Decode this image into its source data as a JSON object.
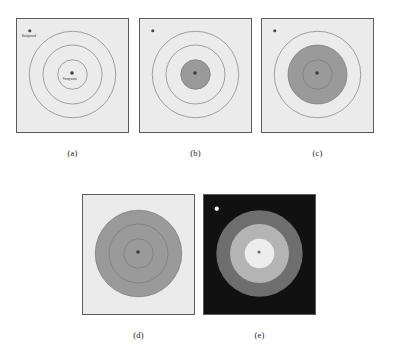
{
  "figure": {
    "background_color": "#ffffff",
    "width": 393,
    "height": 360
  },
  "labels": {
    "background": "Background",
    "foreground": "Foreground"
  },
  "colors": {
    "panel_border": "#5a5a5a",
    "image_background": "#ebebeb",
    "contour_stroke": "#8a8a8a",
    "fill_gray": "#9a9a9a",
    "result_background": "#111111",
    "ring_outer": "#6e6e6e",
    "ring_middle": "#b4b4b4",
    "ring_inner": "#ededed",
    "seed_background_dark": "#4a4a4a",
    "seed_background_light": "#f2f2f2",
    "seed_foreground": "#3c3c3c"
  },
  "panels": [
    {
      "id": "a",
      "caption": "(a)",
      "type": "input-with-seeds",
      "x": 16,
      "y": 18,
      "w": 113,
      "h": 115,
      "caption_x": 16,
      "caption_y": 148,
      "caption_w": 113,
      "background": "#ebebeb",
      "filled_ring_index": -1,
      "circles": [
        {
          "name": "outer-contour",
          "r": 44,
          "fill": "none",
          "stroke": "#8a8a8a"
        },
        {
          "name": "middle-contour",
          "r": 30,
          "fill": "none",
          "stroke": "#8a8a8a"
        },
        {
          "name": "inner-contour",
          "r": 15,
          "fill": "none",
          "stroke": "#8a8a8a"
        }
      ],
      "seeds": [
        {
          "name": "background-seed",
          "cx": 13,
          "cy": 12,
          "r": 1.6,
          "color": "#4a4a4a",
          "label": "Background",
          "label_x": 5,
          "label_y": 16
        },
        {
          "name": "foreground-seed",
          "cx": 56,
          "cy": 55,
          "r": 1.8,
          "color": "#3c3c3c",
          "label": "Foreground",
          "label_x": 46,
          "label_y": 59
        }
      ]
    },
    {
      "id": "b",
      "caption": "(b)",
      "type": "growing-step",
      "x": 139,
      "y": 18,
      "w": 113,
      "h": 115,
      "caption_x": 139,
      "caption_y": 148,
      "caption_w": 113,
      "background": "#ebebeb",
      "filled_ring_index": 2,
      "circles": [
        {
          "name": "outer-contour",
          "r": 44,
          "fill": "none",
          "stroke": "#8a8a8a"
        },
        {
          "name": "middle-contour",
          "r": 30,
          "fill": "none",
          "stroke": "#8a8a8a"
        },
        {
          "name": "inner-contour",
          "r": 15,
          "fill": "#9a9a9a",
          "stroke": "#7d7d7d"
        }
      ],
      "seeds": [
        {
          "name": "background-seed",
          "cx": 13,
          "cy": 12,
          "r": 1.6,
          "color": "#4a4a4a",
          "label": "",
          "label_x": 0,
          "label_y": 0
        },
        {
          "name": "foreground-seed",
          "cx": 56,
          "cy": 55,
          "r": 1.8,
          "color": "#3c3c3c",
          "label": "",
          "label_x": 0,
          "label_y": 0
        }
      ]
    },
    {
      "id": "c",
      "caption": "(c)",
      "type": "growing-step",
      "x": 261,
      "y": 18,
      "w": 113,
      "h": 115,
      "caption_x": 261,
      "caption_y": 148,
      "caption_w": 113,
      "background": "#ebebeb",
      "filled_ring_index": 1,
      "circles": [
        {
          "name": "outer-contour",
          "r": 44,
          "fill": "none",
          "stroke": "#8a8a8a"
        },
        {
          "name": "middle-contour",
          "r": 30,
          "fill": "#9a9a9a",
          "stroke": "#7d7d7d"
        },
        {
          "name": "inner-contour",
          "r": 15,
          "fill": "none",
          "stroke": "#7d7d7d"
        }
      ],
      "seeds": [
        {
          "name": "background-seed",
          "cx": 13,
          "cy": 12,
          "r": 1.6,
          "color": "#4a4a4a",
          "label": "",
          "label_x": 0,
          "label_y": 0
        },
        {
          "name": "foreground-seed",
          "cx": 56,
          "cy": 55,
          "r": 1.8,
          "color": "#3c3c3c",
          "label": "",
          "label_x": 0,
          "label_y": 0
        }
      ]
    },
    {
      "id": "d",
      "caption": "(d)",
      "type": "growing-step",
      "x": 82,
      "y": 194,
      "w": 113,
      "h": 121,
      "caption_x": 82,
      "caption_y": 330,
      "caption_w": 113,
      "background": "#ebebeb",
      "filled_ring_index": 0,
      "circles": [
        {
          "name": "outer-contour",
          "r": 44,
          "fill": "#9a9a9a",
          "stroke": "#7d7d7d"
        },
        {
          "name": "middle-contour",
          "r": 30,
          "fill": "none",
          "stroke": "#7d7d7d"
        },
        {
          "name": "inner-contour",
          "r": 15,
          "fill": "none",
          "stroke": "#7d7d7d"
        }
      ],
      "seeds": [
        {
          "name": "foreground-seed",
          "cx": 56,
          "cy": 58,
          "r": 1.8,
          "color": "#3c3c3c",
          "label": "",
          "label_x": 0,
          "label_y": 0
        }
      ]
    },
    {
      "id": "e",
      "caption": "(e)",
      "type": "segmentation-result",
      "x": 203,
      "y": 194,
      "w": 113,
      "h": 121,
      "caption_x": 203,
      "caption_y": 330,
      "caption_w": 113,
      "background": "#111111",
      "filled_ring_index": -1,
      "circles": [
        {
          "name": "outer-region",
          "r": 44,
          "fill": "#6e6e6e",
          "stroke": "none"
        },
        {
          "name": "middle-region",
          "r": 30,
          "fill": "#b4b4b4",
          "stroke": "none"
        },
        {
          "name": "inner-region",
          "r": 15,
          "fill": "#ededed",
          "stroke": "none"
        }
      ],
      "seeds": [
        {
          "name": "background-seed",
          "cx": 13,
          "cy": 14,
          "r": 2.2,
          "color": "#f2f2f2",
          "label": "",
          "label_x": 0,
          "label_y": 0
        },
        {
          "name": "foreground-seed",
          "cx": 56,
          "cy": 58,
          "r": 1.6,
          "color": "#6a6a6a",
          "label": "",
          "label_x": 0,
          "label_y": 0
        }
      ]
    }
  ]
}
